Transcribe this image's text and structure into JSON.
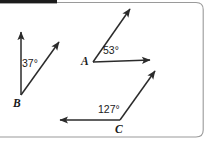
{
  "figure": {
    "background_color": "#ffffff",
    "stroke_color": "#2b2b2b",
    "border_color": "#9a9a9a",
    "header_bar_color": "#1c1c1c",
    "angles": [
      {
        "id": "B",
        "vertex_label": "B",
        "measure_label": "37°",
        "measure_value": 37,
        "vertex": {
          "x": 21,
          "y": 95
        },
        "rays": [
          {
            "name": "vertical-ray",
            "to": {
              "x": 21,
              "y": 30
            }
          },
          {
            "name": "diagonal-ray",
            "to": {
              "x": 61,
              "y": 40
            }
          }
        ]
      },
      {
        "id": "A",
        "vertex_label": "A",
        "measure_label": "53°",
        "measure_value": 53,
        "vertex": {
          "x": 93,
          "y": 62
        },
        "rays": [
          {
            "name": "horizontal-ray",
            "to": {
              "x": 153,
              "y": 60
            }
          },
          {
            "name": "diagonal-ray",
            "to": {
              "x": 132,
              "y": 7
            }
          }
        ]
      },
      {
        "id": "C",
        "vertex_label": "C",
        "measure_label": "127°",
        "measure_value": 127,
        "vertex": {
          "x": 120,
          "y": 120
        },
        "rays": [
          {
            "name": "left-ray",
            "to": {
              "x": 57,
              "y": 120
            }
          },
          {
            "name": "diagonal-ray",
            "to": {
              "x": 157,
              "y": 69
            }
          }
        ]
      }
    ]
  }
}
